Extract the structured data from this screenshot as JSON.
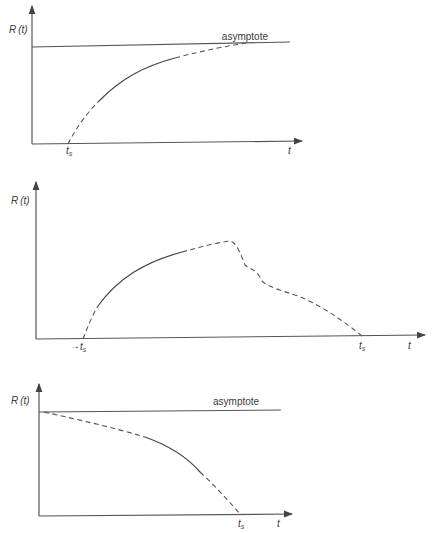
{
  "figure": {
    "panels": [
      {
        "id": "a",
        "y_label": "R(t)",
        "x_label": "t",
        "asymptote_label": "asymptote",
        "markers": [
          "ts"
        ]
      },
      {
        "id": "b",
        "y_label": "R(t)",
        "x_label": "t",
        "markers": [
          "ts",
          "ts"
        ]
      },
      {
        "id": "c",
        "y_label": "R(t)",
        "x_label": "t",
        "asymptote_label": "asymptote",
        "markers": [
          "ts"
        ]
      }
    ]
  },
  "labels": {
    "R": "R",
    "t_paren": "(t)",
    "t": "t",
    "ts_main": "t",
    "ts_sub": "s",
    "asymptote": "asymptote"
  }
}
